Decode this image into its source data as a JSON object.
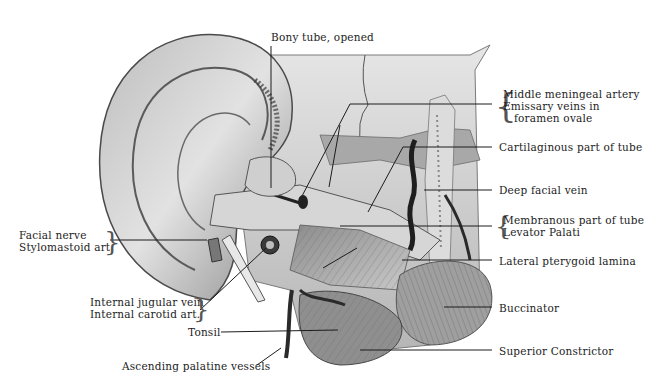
{
  "figure": {
    "style": "grayscale anatomical engraving",
    "colors": {
      "background": "#ffffff",
      "ink": "#1c1c1c",
      "tissue_light": "#d8d8d8",
      "tissue_mid": "#9a9a9a",
      "tissue_dark": "#3a3a3a"
    }
  },
  "labels": {
    "top": [
      {
        "id": "bony-tube",
        "text": "Bony tube, opened"
      }
    ],
    "right": [
      {
        "id": "middle-meningeal",
        "lines": [
          "Middle meningeal artery",
          "Emissary veins in",
          "  foramen ovale"
        ]
      },
      {
        "id": "cartilaginous",
        "text": "Cartilaginous part of tube"
      },
      {
        "id": "deep-facial-vein",
        "text": "Deep facial vein"
      },
      {
        "id": "membranous",
        "lines": [
          "Membranous part of tube",
          "Levator Palati"
        ]
      },
      {
        "id": "lateral-pterygoid",
        "text": "Lateral pterygoid lamina"
      },
      {
        "id": "buccinator",
        "text": "Buccinator"
      },
      {
        "id": "superior-constrictor",
        "text": "Superior Constrictor"
      }
    ],
    "left": [
      {
        "id": "facial-nerve",
        "lines": [
          "Facial nerve",
          "Stylomastoid art."
        ]
      },
      {
        "id": "jugular-carotid",
        "lines": [
          "Internal jugular vein",
          "Internal carotid art."
        ]
      },
      {
        "id": "tonsil",
        "text": "Tonsil"
      },
      {
        "id": "ascending-palatine",
        "text": "Ascending palatine vessels"
      }
    ]
  }
}
